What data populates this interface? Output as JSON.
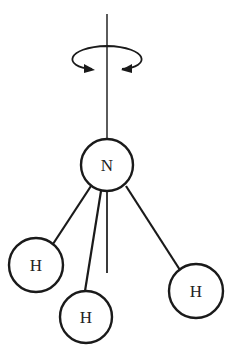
{
  "diagram": {
    "colors": {
      "stroke": "#1a1a1a",
      "axis": "#333333",
      "background": "#ffffff"
    },
    "axis": {
      "x": 107,
      "y1": 14,
      "y2": 273
    },
    "rotation_arrow": {
      "cx": 107,
      "cy": 60,
      "rx": 35,
      "ry": 14,
      "icon": "rotation-arrow-icon"
    },
    "atoms": [
      {
        "id": "N",
        "label": "N",
        "cx": 107,
        "cy": 165,
        "r": 26
      },
      {
        "id": "H1",
        "label": "H",
        "cx": 36,
        "cy": 265,
        "r": 27
      },
      {
        "id": "H2",
        "label": "H",
        "cx": 86,
        "cy": 317,
        "r": 26
      },
      {
        "id": "H3",
        "label": "H",
        "cx": 196,
        "cy": 291,
        "r": 27
      }
    ],
    "bonds": [
      {
        "from": "N",
        "to": "H1"
      },
      {
        "from": "N",
        "to": "H2"
      },
      {
        "from": "N",
        "to": "H3"
      }
    ]
  }
}
